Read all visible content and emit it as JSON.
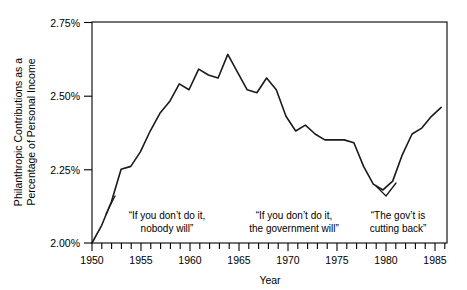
{
  "chart_data": {
    "type": "line",
    "title": "",
    "xlabel": "Year",
    "ylabel": "Philanthropic Contributions as a Percentage of Personal Income",
    "ylabel_line1": "Philanthropic Contributions as a",
    "ylabel_line2": "Percentage of Personal Income",
    "xlim": [
      1950,
      1986.6
    ],
    "ylim": [
      2.0,
      2.75
    ],
    "grid": false,
    "legend": "none",
    "y_tick_labels": [
      "2.75%",
      "2.50%",
      "2.25%",
      "2.00%"
    ],
    "y_ticks": [
      2.75,
      2.5,
      2.25,
      2.0
    ],
    "x_tick_labels": [
      "1950",
      "1955",
      "1960",
      "1965",
      "1970",
      "1975",
      "1980",
      "1985"
    ],
    "x_ticks": [
      1950,
      1955,
      1960,
      1965,
      1970,
      1975,
      1980,
      1985
    ],
    "x_minor_tick_interval": 1,
    "line_color": "#1a1a1a",
    "x": [
      1950,
      1951,
      1952,
      1953,
      1954,
      1955,
      1956,
      1957,
      1958,
      1959,
      1960,
      1961,
      1962,
      1963,
      1964,
      1965,
      1966,
      1967,
      1968,
      1969,
      1970,
      1971,
      1972,
      1973,
      1974,
      1975,
      1976,
      1977,
      1978,
      1979,
      1980,
      1981,
      1982,
      1983,
      1984,
      1985,
      1986
    ],
    "values": [
      2.0,
      2.06,
      2.14,
      2.25,
      2.26,
      2.31,
      2.38,
      2.44,
      2.48,
      2.54,
      2.52,
      2.59,
      2.57,
      2.56,
      2.64,
      2.58,
      2.52,
      2.51,
      2.56,
      2.52,
      2.43,
      2.38,
      2.4,
      2.37,
      2.35,
      2.35,
      2.35,
      2.34,
      2.26,
      2.2,
      2.18,
      2.21,
      2.3,
      2.37,
      2.39,
      2.43,
      2.46
    ],
    "annotations": [
      {
        "id": "annotation-1950s",
        "line1": "“If you don’t do it,",
        "line2": "nobody will”",
        "has_leader": true
      },
      {
        "id": "annotation-1960s-70s",
        "line1": "“If you don’t do it,",
        "line2": "the government will”",
        "has_leader": false
      },
      {
        "id": "annotation-1980s",
        "line1": "“The gov’t is",
        "line2": "cutting back”",
        "has_leader": true
      }
    ]
  }
}
